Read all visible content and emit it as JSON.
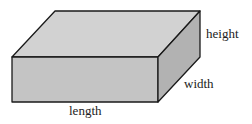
{
  "diagram": {
    "labels": {
      "height": "height",
      "width": "width",
      "length": "length"
    },
    "colors": {
      "top_face": "#d2d2d2",
      "front_face": "#c4c4c4",
      "side_face": "#b2b2b2",
      "edge": "#1a1a1a",
      "text": "#222222"
    }
  }
}
